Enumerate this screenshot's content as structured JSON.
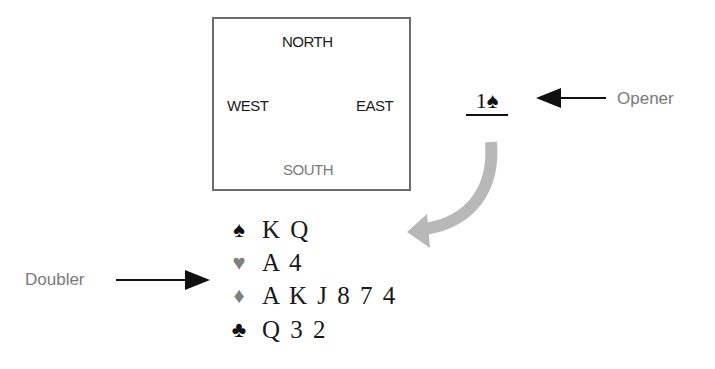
{
  "diagram": {
    "table": {
      "north": "NORTH",
      "west": "WEST",
      "east": "EAST",
      "south": "SOUTH"
    },
    "bid": {
      "level": "1",
      "suit": "♠",
      "text": "1♠"
    },
    "labels": {
      "opener": "Opener",
      "doubler": "Doubler"
    },
    "hand": [
      {
        "suit": "♠",
        "suit_name": "spades",
        "cards": "K Q",
        "color": "#111111"
      },
      {
        "suit": "♥",
        "suit_name": "hearts",
        "cards": "A 4",
        "color": "#808080"
      },
      {
        "suit": "♦",
        "suit_name": "diamonds",
        "cards": "A K J 8 7 4",
        "color": "#808080"
      },
      {
        "suit": "♣",
        "suit_name": "clubs",
        "cards": "Q 3 2",
        "color": "#111111"
      }
    ],
    "colors": {
      "box_border": "#6b6b6b",
      "curved_arrow": "#b8b8b8",
      "label_text": "#7a7a7a",
      "black_text": "#111111"
    }
  }
}
